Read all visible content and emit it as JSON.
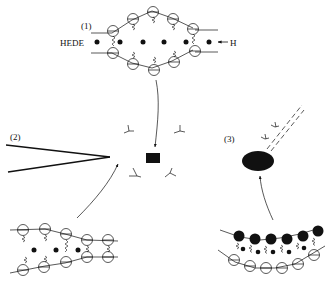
{
  "diagram": {
    "panel1": {
      "label": "(1)",
      "left_text": "HEDE",
      "right_text": "H"
    },
    "panel2": {
      "label": "(2)"
    },
    "panel3": {
      "label": "(3)"
    }
  },
  "colors": {
    "ink": "#111111",
    "background": "#ffffff"
  }
}
